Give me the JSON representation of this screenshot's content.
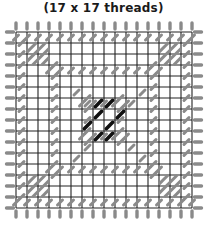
{
  "title": "(17 x 17 threads)",
  "grid": {
    "threads": 17,
    "origin_x": 16,
    "origin_y": 32,
    "spacing": 11,
    "line_color": "#222222",
    "stitch_color": "#8a8a8a",
    "center_stitch_color": "#111111",
    "hatch_color": "#8a8a8a"
  },
  "legend": {
    "outer_stitches": "grey edge stitches",
    "corner_blocks": "hatched corner squares",
    "center": "black center stitches"
  }
}
